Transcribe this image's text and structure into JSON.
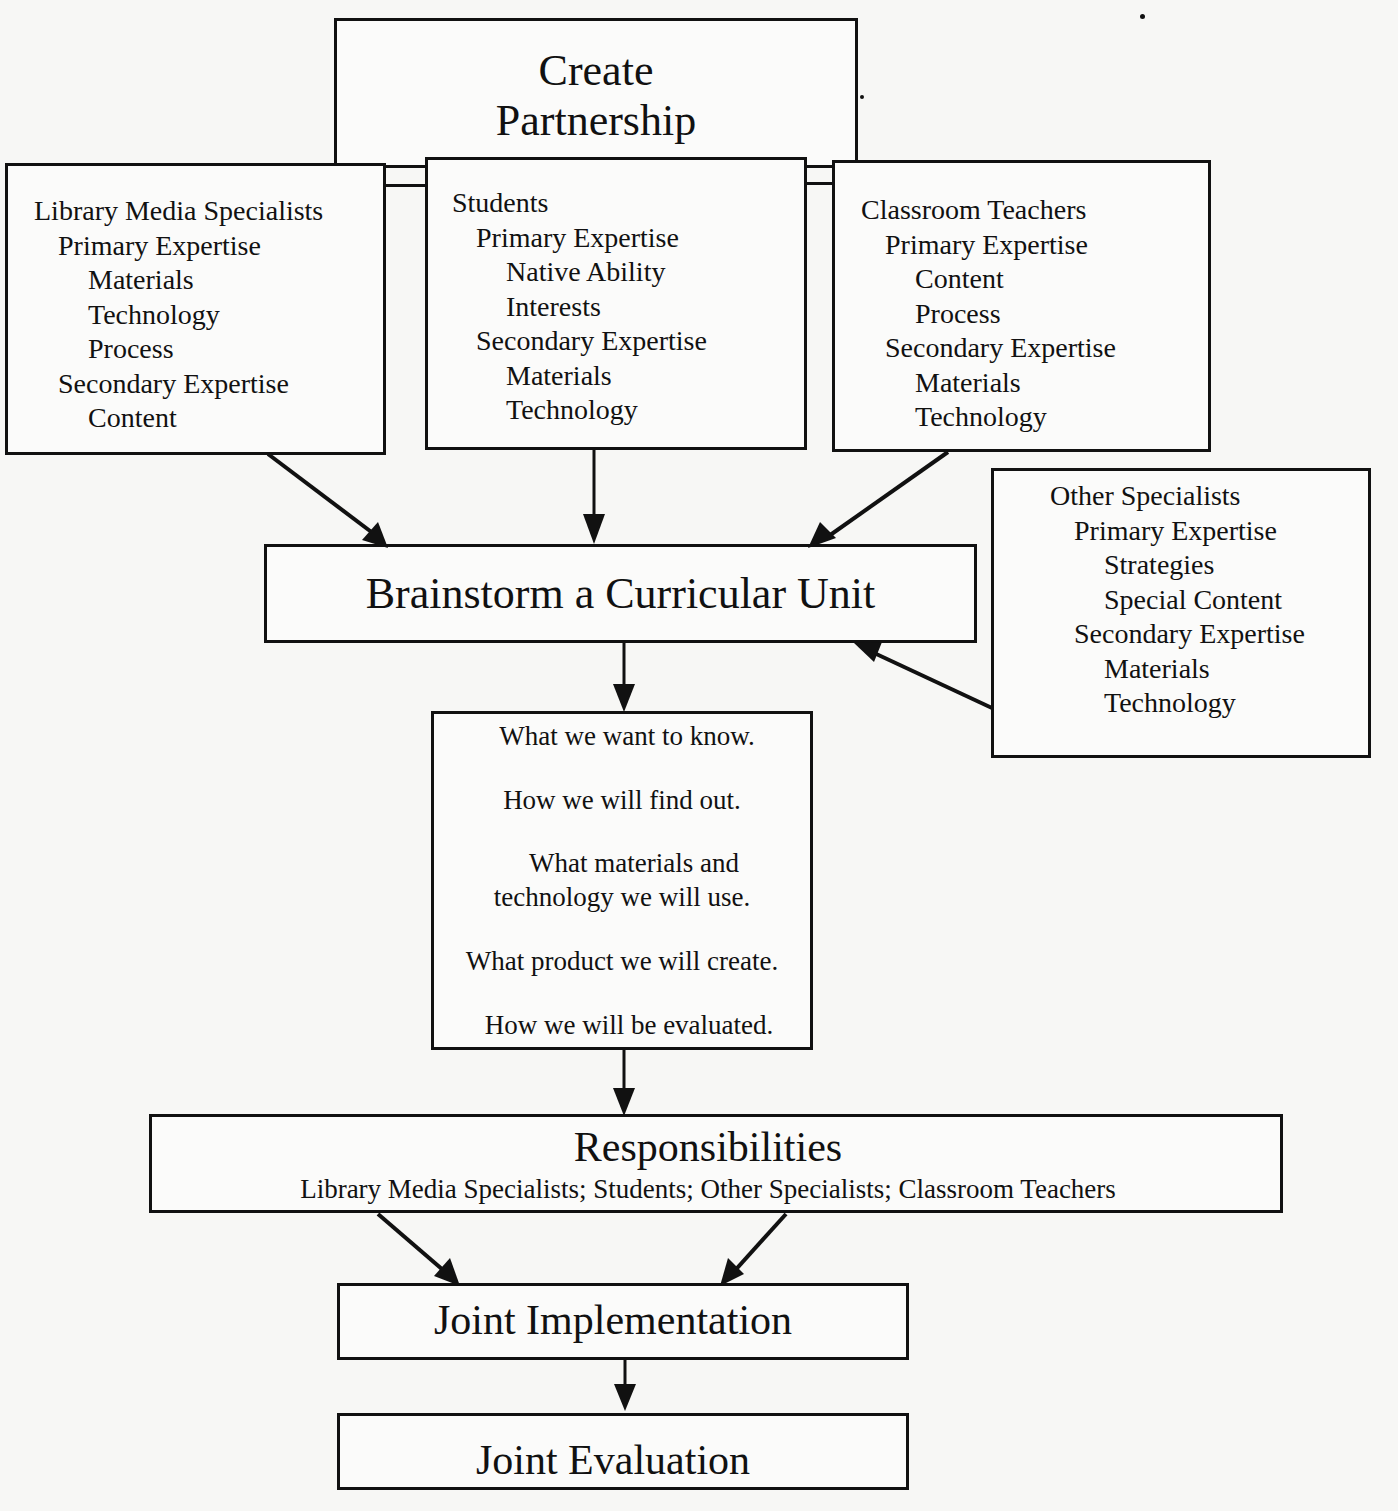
{
  "diagram": {
    "colors": {
      "ink": "#111111",
      "paper": "#f7f7f5"
    },
    "create_partnership": {
      "line1": "Create",
      "line2": "Partnership"
    },
    "library_media_specialists": {
      "title": "Library Media Specialists",
      "primary_label": "Primary Expertise",
      "primary_items": [
        "Materials",
        "Technology",
        "Process"
      ],
      "secondary_label": "Secondary Expertise",
      "secondary_items": [
        "Content"
      ]
    },
    "students": {
      "title": "Students",
      "primary_label": "Primary Expertise",
      "primary_items": [
        "Native Ability",
        "Interests"
      ],
      "secondary_label": "Secondary Expertise",
      "secondary_items": [
        "Materials",
        "Technology"
      ]
    },
    "classroom_teachers": {
      "title": "Classroom Teachers",
      "primary_label": "Primary Expertise",
      "primary_items": [
        "Content",
        "Process"
      ],
      "secondary_label": "Secondary Expertise",
      "secondary_items": [
        "Materials",
        "Technology"
      ]
    },
    "other_specialists": {
      "title": "Other Specialists",
      "primary_label": "Primary Expertise",
      "primary_items": [
        "Strategies",
        "Special Content"
      ],
      "secondary_label": "Secondary Expertise",
      "secondary_items": [
        "Materials",
        "Technology"
      ]
    },
    "brainstorm": {
      "label": "Brainstorm a Curricular Unit"
    },
    "questions": {
      "items": [
        "What we want to know.",
        "How we will find out.",
        "What materials and",
        "technology we will use.",
        "What product we will create.",
        "How we will be evaluated."
      ]
    },
    "responsibilities": {
      "title": "Responsibilities",
      "subtitle": "Library Media Specialists; Students; Other Specialists; Classroom Teachers"
    },
    "joint_implementation": {
      "label": "Joint Implementation"
    },
    "joint_evaluation": {
      "label": "Joint Evaluation"
    }
  }
}
